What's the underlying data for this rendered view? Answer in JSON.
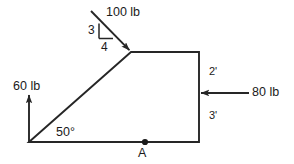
{
  "figure": {
    "type": "free-body-diagram",
    "background_color": "#ffffff",
    "line_color": "#262626",
    "text_color": "#1a1a1a",
    "forces": [
      {
        "id": "force-100lb",
        "label": "100 lb",
        "magnitude": 100,
        "unit": "lb",
        "direction": "down-right",
        "slope_rise": "3",
        "slope_run": "4",
        "applied_at": "apex"
      },
      {
        "id": "force-60lb",
        "label": "60 lb",
        "magnitude": 60,
        "unit": "lb",
        "direction": "up",
        "applied_at": "bottom-left-vertex"
      },
      {
        "id": "force-80lb",
        "label": "80 lb",
        "magnitude": 80,
        "unit": "lb",
        "direction": "left",
        "applied_at": "right-edge"
      }
    ],
    "dimensions": [
      {
        "id": "dim-upper-right",
        "label": "2'",
        "value": "2",
        "unit": "ft"
      },
      {
        "id": "dim-lower-right",
        "label": "3'",
        "value": "3",
        "unit": "ft"
      }
    ],
    "angles": [
      {
        "id": "angle-base-left",
        "label": "50°",
        "value": "50",
        "unit": "deg"
      }
    ],
    "points": [
      {
        "id": "point-a",
        "label": "A",
        "location": "bottom-edge"
      }
    ],
    "slope_triangle": {
      "rise_label": "3",
      "run_label": "4"
    }
  }
}
